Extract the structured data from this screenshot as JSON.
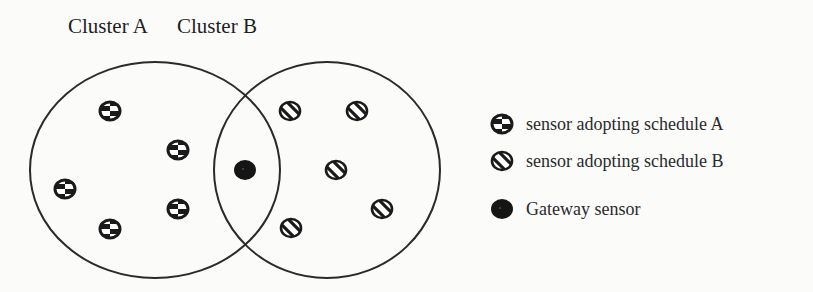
{
  "clusters": [
    {
      "label": "Cluster A",
      "center": [
        155,
        170
      ],
      "radius": [
        125,
        108
      ]
    },
    {
      "label": "Cluster B",
      "center": [
        327,
        170
      ],
      "radius": [
        113,
        108
      ]
    }
  ],
  "sensors": {
    "schedule_a": [
      [
        110,
        111
      ],
      [
        178,
        150
      ],
      [
        65,
        189
      ],
      [
        110,
        229
      ],
      [
        178,
        209
      ]
    ],
    "schedule_b": [
      [
        290,
        111
      ],
      [
        357,
        111
      ],
      [
        336,
        170
      ],
      [
        382,
        209
      ],
      [
        291,
        228
      ]
    ],
    "gateway": [
      [
        245,
        170
      ]
    ]
  },
  "legend": {
    "items": [
      {
        "icon": "checker-sensor-icon",
        "label": "sensor adopting schedule A"
      },
      {
        "icon": "striped-sensor-icon",
        "label": "sensor adopting schedule B"
      },
      {
        "icon": "gateway-sensor-icon",
        "label": "Gateway sensor"
      }
    ]
  },
  "colors": {
    "stroke": "#2a2a2a",
    "fill": "#1a1a1a",
    "background": "#fbfbfa"
  }
}
